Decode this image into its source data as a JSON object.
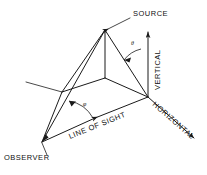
{
  "figure": {
    "labels": {
      "source": "SOURCE",
      "observer": "OBSERVER",
      "vertical": "VERTICAL",
      "horizontal": "HORIZONTAL",
      "line_of_sight": "LINE OF SIGHT",
      "angle_upper": "θ",
      "angle_lower": "φ"
    },
    "colors": {
      "ink": "#1a1a1a",
      "background": "#ffffff"
    },
    "geometry": {
      "source_apex": [
        105,
        30
      ],
      "base_center": [
        105,
        78
      ],
      "right_vertex": [
        148,
        97
      ],
      "left_vertex": [
        62,
        92
      ],
      "observer_vertex": [
        42,
        142
      ],
      "vertical_arrow_top": [
        148,
        30
      ],
      "horizontal_arrow_end": [
        196,
        140
      ]
    }
  }
}
